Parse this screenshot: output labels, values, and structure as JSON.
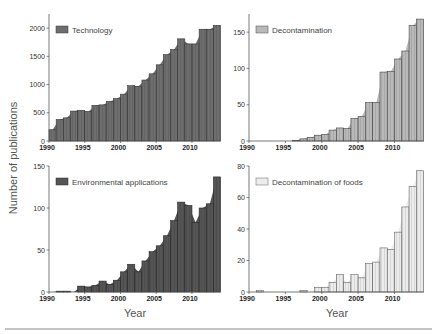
{
  "figure": {
    "ylabel": "Number of publications",
    "xlabel_left": "Year",
    "xlabel_right": "Year"
  },
  "chart_data": [
    {
      "type": "bar",
      "title": "Technology",
      "legend": "Technology",
      "xlabel": "",
      "ylabel": "Number of publications",
      "categories": [
        1990,
        1991,
        1992,
        1993,
        1994,
        1995,
        1996,
        1997,
        1998,
        1999,
        2000,
        2001,
        2002,
        2003,
        2004,
        2005,
        2006,
        2007,
        2008,
        2009,
        2010,
        2011,
        2012,
        2013
      ],
      "values": [
        200,
        380,
        410,
        530,
        540,
        520,
        630,
        640,
        700,
        750,
        830,
        980,
        970,
        1080,
        1190,
        1350,
        1530,
        1620,
        1810,
        1720,
        1720,
        1980,
        1980,
        2050
      ],
      "ylim": [
        0,
        2250
      ],
      "yticks": [
        0,
        500,
        1000,
        1500,
        2000
      ],
      "xticks": [
        1990,
        1995,
        2000,
        2005,
        2010
      ],
      "fill": "#6e6e6e",
      "stroke": "#3a3a3a",
      "style": "bar+area",
      "legend_position": "upper left"
    },
    {
      "type": "bar",
      "title": "Decontamination",
      "legend": "Decontamination",
      "xlabel": "",
      "ylabel": "",
      "categories": [
        1990,
        1991,
        1992,
        1993,
        1994,
        1995,
        1996,
        1997,
        1998,
        1999,
        2000,
        2001,
        2002,
        2003,
        2004,
        2005,
        2006,
        2007,
        2008,
        2009,
        2010,
        2011,
        2012,
        2013
      ],
      "values": [
        0,
        0,
        0,
        0,
        0,
        0,
        1,
        3,
        5,
        8,
        9,
        15,
        18,
        17,
        31,
        34,
        53,
        53,
        95,
        96,
        113,
        124,
        159,
        168
      ],
      "ylim": [
        0,
        175
      ],
      "yticks": [
        0,
        50,
        100,
        150
      ],
      "xticks": [
        1990,
        1995,
        2000,
        2005,
        2010
      ],
      "fill": "#b9b9b9",
      "stroke": "#4a4a4a",
      "style": "bar+area",
      "legend_position": "upper left"
    },
    {
      "type": "bar",
      "title": "Environmental applications",
      "legend": "Environmental applications",
      "xlabel": "Year",
      "ylabel": "Number of publications",
      "categories": [
        1990,
        1991,
        1992,
        1993,
        1994,
        1995,
        1996,
        1997,
        1998,
        1999,
        2000,
        2001,
        2002,
        2003,
        2004,
        2005,
        2006,
        2007,
        2008,
        2009,
        2010,
        2011,
        2012,
        2013
      ],
      "values": [
        0,
        1,
        1,
        0,
        7,
        6,
        8,
        13,
        9,
        14,
        24,
        33,
        24,
        37,
        48,
        55,
        67,
        85,
        107,
        103,
        83,
        100,
        105,
        137
      ],
      "ylim": [
        0,
        150
      ],
      "yticks": [
        0,
        50,
        100,
        150
      ],
      "xticks": [
        1990,
        1995,
        2000,
        2005,
        2010
      ],
      "fill": "#555555",
      "stroke": "#2a2a2a",
      "style": "bar+area",
      "legend_position": "upper left"
    },
    {
      "type": "bar",
      "title": "Decontamination of foods",
      "legend": "Decontamination of foods",
      "xlabel": "Year",
      "ylabel": "",
      "categories": [
        1990,
        1991,
        1992,
        1993,
        1994,
        1995,
        1996,
        1997,
        1998,
        1999,
        2000,
        2001,
        2002,
        2003,
        2004,
        2005,
        2006,
        2007,
        2008,
        2009,
        2010,
        2011,
        2012,
        2013
      ],
      "values": [
        0,
        1,
        0,
        0,
        0,
        0,
        0,
        1,
        0,
        3,
        3,
        6,
        11,
        6,
        11,
        9,
        18,
        19,
        28,
        27,
        38,
        54,
        67,
        77
      ],
      "ylim": [
        0,
        80
      ],
      "yticks": [
        0,
        20,
        40,
        60,
        80
      ],
      "xticks": [
        1990,
        1995,
        2000,
        2005,
        2010
      ],
      "fill": "#ececec",
      "stroke": "#666666",
      "style": "bar+area",
      "legend_position": "upper left"
    }
  ]
}
